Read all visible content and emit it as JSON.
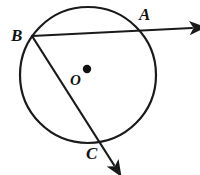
{
  "figure": {
    "background_color": "#ffffff",
    "stroke_color": "#1a1a1a",
    "label_color": "#111111",
    "circle": {
      "name": "circle-o",
      "center_x": 88,
      "center_y": 75,
      "radius": 68,
      "stroke_width": 2.2
    },
    "center_point": {
      "name": "center-dot",
      "x": 87,
      "y": 69,
      "radius": 4.2,
      "label": "O",
      "label_x": 70,
      "label_y": 85
    },
    "points": [
      {
        "id": "B",
        "label": "B",
        "x": 32,
        "y": 36,
        "label_x": 11,
        "label_y": 41
      },
      {
        "id": "A",
        "label": "A",
        "x": 143,
        "y": 30,
        "label_x": 139,
        "label_y": 20
      },
      {
        "id": "C",
        "label": "C",
        "x": 97,
        "y": 140,
        "label_x": 86,
        "label_y": 159
      }
    ],
    "rays": [
      {
        "id": "ray-BA",
        "name": "ray-b-to-a",
        "from": "B",
        "through": "A",
        "start_x": 32,
        "start_y": 36,
        "end_x": 192,
        "end_y": 28,
        "stroke_width": 2.2,
        "arrow": true
      },
      {
        "id": "ray-BC",
        "name": "ray-b-to-c",
        "from": "B",
        "through": "C",
        "start_x": 32,
        "start_y": 36,
        "end_x": 114,
        "end_y": 165,
        "stroke_width": 2.2,
        "arrow": true
      }
    ]
  }
}
